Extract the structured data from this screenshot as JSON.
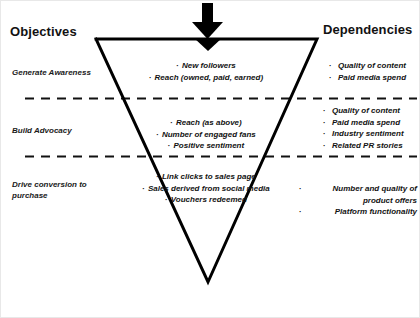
{
  "diagram": {
    "title_left": "Objectives",
    "title_right": "Dependencies",
    "arrow_icon": "thick-down-arrow-icon",
    "colors": {
      "ink": "#121212",
      "outline": "#000000",
      "background": "#ffffff",
      "divider": "#111111"
    },
    "shape": {
      "type": "inverted-triangle",
      "top_left_x": 95,
      "top_right_x": 316,
      "top_y": 38,
      "apex_x": 207,
      "apex_y": 281
    },
    "stages": [
      {
        "objective": "Generate Awareness",
        "core_metrics": [
          "New followers",
          "Reach (owned, paid, earned)"
        ],
        "dependencies": [
          "Quality of content",
          "Paid media spend"
        ]
      },
      {
        "objective": "Build Advocacy",
        "core_metrics": [
          "Reach (as above)",
          "Number of engaged fans",
          "Positive sentiment"
        ],
        "dependencies": [
          "Quality of content",
          "Paid media spend",
          "Industry sentiment",
          "Related PR stories"
        ]
      },
      {
        "objective": "Drive conversion to purchase",
        "core_metrics": [
          "Link clicks to sales page",
          "Sales derived from social media",
          "Vouchers redeemed"
        ],
        "dependencies": [
          "Number and quality of product offers",
          "Platform functionality"
        ]
      }
    ],
    "bullet_glyph": "·",
    "dividers": [
      {
        "y": 97,
        "label": "stage-divider-1"
      },
      {
        "y": 155,
        "label": "stage-divider-2"
      }
    ]
  }
}
